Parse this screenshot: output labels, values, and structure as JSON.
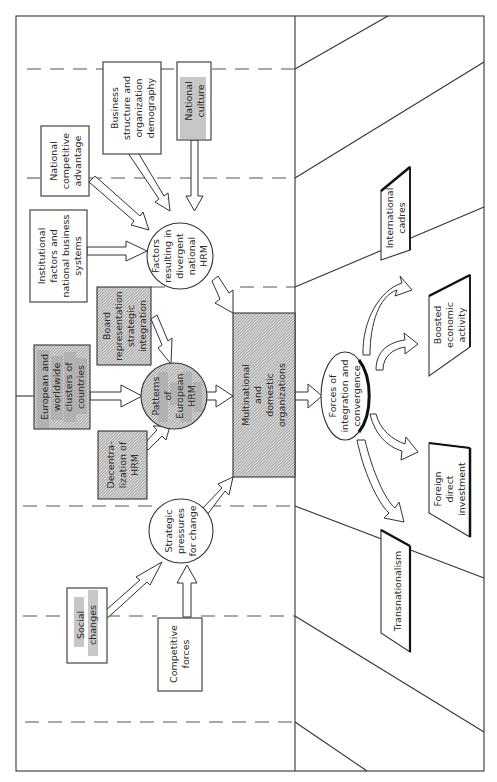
{
  "diagram": {
    "orientation": "rotated-90-ccw",
    "nodes": {
      "national_culture": {
        "label": [
          "National",
          "culture"
        ],
        "style": "highlighted"
      },
      "business_structure": {
        "label": [
          "Business",
          "structure and",
          "organization",
          "demography"
        ],
        "style": "box"
      },
      "national_competitive": {
        "label": [
          "National",
          "competitive",
          "advantage"
        ],
        "style": "box"
      },
      "institutional": {
        "label": [
          "Institutional",
          "factors and",
          "national business",
          "systems"
        ],
        "style": "box"
      },
      "factors_divergent": {
        "label": [
          "Factors",
          "resulting in",
          "divergent",
          "national",
          "HRM"
        ],
        "style": "circle"
      },
      "board_representation": {
        "label": [
          "Board",
          "representation",
          "strategic",
          "integration"
        ],
        "style": "shaded-box"
      },
      "european_clusters": {
        "label": [
          "European and",
          "worldwide",
          "clusters of",
          "countries"
        ],
        "style": "shaded-box-highlighted"
      },
      "patterns_european": {
        "label": [
          "Patterns",
          "of",
          "European",
          "HRM"
        ],
        "style": "shaded-circle"
      },
      "decentralization": {
        "label": [
          "Decentra-",
          "lization of",
          "HRM"
        ],
        "style": "shaded-box"
      },
      "multinational": {
        "label": [
          "Multinational",
          "and",
          "domestic",
          "organizations"
        ],
        "style": "shaded-box"
      },
      "strategic_pressures": {
        "label": [
          "Strategic",
          "pressures",
          "for change"
        ],
        "style": "circle"
      },
      "social_changes": {
        "label": [
          "Social",
          "changes"
        ],
        "style": "box-highlighted"
      },
      "competitive_forces": {
        "label": [
          "Competitive",
          "forces"
        ],
        "style": "box"
      },
      "forces_integration": {
        "label": [
          "Forces of",
          "integration and",
          "convergence"
        ],
        "style": "ellipse"
      },
      "international_cadres": {
        "label": [
          "International",
          "cadres"
        ],
        "style": "parallelogram"
      },
      "boosted_economic": {
        "label": [
          "Boosted",
          "economic",
          "activity"
        ],
        "style": "parallelogram"
      },
      "foreign_direct": {
        "label": [
          "Foreign",
          "direct",
          "investment"
        ],
        "style": "parallelogram"
      },
      "transnationalism": {
        "label": [
          "Transnationalism"
        ],
        "style": "parallelogram"
      }
    },
    "edges": [
      {
        "from": "national_culture",
        "to": "factors_divergent"
      },
      {
        "from": "business_structure",
        "to": "factors_divergent"
      },
      {
        "from": "national_competitive",
        "to": "factors_divergent"
      },
      {
        "from": "institutional",
        "to": "factors_divergent"
      },
      {
        "from": "factors_divergent",
        "to": "multinational"
      },
      {
        "from": "board_representation",
        "to": "patterns_european"
      },
      {
        "from": "european_clusters",
        "to": "patterns_european"
      },
      {
        "from": "decentralization",
        "to": "patterns_european"
      },
      {
        "from": "patterns_european",
        "to": "multinational"
      },
      {
        "from": "social_changes",
        "to": "strategic_pressures"
      },
      {
        "from": "competitive_forces",
        "to": "strategic_pressures"
      },
      {
        "from": "strategic_pressures",
        "to": "multinational"
      },
      {
        "from": "multinational",
        "to": "forces_integration"
      },
      {
        "from": "forces_integration",
        "to": "international_cadres"
      },
      {
        "from": "forces_integration",
        "to": "boosted_economic"
      },
      {
        "from": "forces_integration",
        "to": "foreign_direct"
      },
      {
        "from": "forces_integration",
        "to": "transnationalism"
      }
    ]
  }
}
